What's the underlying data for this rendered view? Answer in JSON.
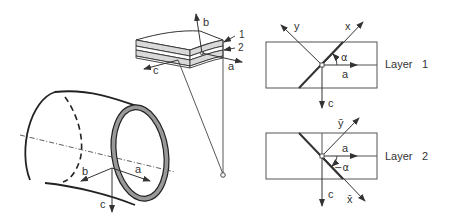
{
  "figure": {
    "tube": {
      "axes": {
        "a": "a",
        "b": "b",
        "c": "c"
      }
    },
    "laminate_element": {
      "axes": {
        "a": "a",
        "b": "b",
        "c": "c"
      },
      "layer_labels": [
        "1",
        "2"
      ]
    },
    "layer1": {
      "title": "Layer",
      "number": "1",
      "axes": {
        "x": "x",
        "y": "y",
        "a": "a",
        "c": "c"
      },
      "angle": "α"
    },
    "layer2": {
      "title": "Layer",
      "number": "2",
      "axes": {
        "x": "x̄",
        "y": "ȳ",
        "a": "a",
        "c": "c"
      },
      "angle": "−α"
    }
  },
  "colors": {
    "line": "#333333",
    "layer_fill": "#d9d9d9",
    "ring_fill": "#999999",
    "background": "#ffffff"
  }
}
